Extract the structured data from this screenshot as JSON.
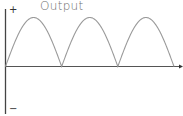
{
  "title": "Output",
  "labels": {
    "positive": "+",
    "negative": "−"
  },
  "colors": {
    "axis": "#444444",
    "wave": "#9a9a9a",
    "title": "#6f6f6f"
  },
  "chart_data": {
    "type": "line",
    "title": "Output",
    "xlabel": "",
    "ylabel": "",
    "y_axis_labels": {
      "top": "+",
      "bottom": "−"
    },
    "series": [
      {
        "name": "output",
        "x": [
          0,
          0.5,
          1,
          1.5,
          2,
          2.5,
          3
        ],
        "values": [
          0,
          1,
          0,
          1,
          0,
          1,
          0
        ]
      }
    ],
    "cycles": 3,
    "ylim": [
      -1.3,
      1.1
    ],
    "grid": false
  }
}
